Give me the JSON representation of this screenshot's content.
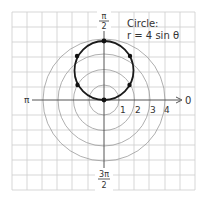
{
  "diagram": {
    "type": "polar-graph",
    "title_line1": "Circle:",
    "title_line2": "r = 4 sin θ",
    "angle_labels": {
      "right": "0",
      "left": "π",
      "top_num": "π",
      "top_den": "2",
      "bottom_num": "3π",
      "bottom_den": "2"
    },
    "radius_labels": [
      "1",
      "2",
      "3",
      "4"
    ],
    "reference_circles": [
      1,
      2,
      3,
      4
    ],
    "curve": {
      "equation": "r = 4 sin θ",
      "center_xy": [
        0,
        2
      ],
      "radius": 2
    },
    "plotted_points_polar": [
      {
        "theta": "0",
        "r": 0
      },
      {
        "theta": "π/6",
        "r": 2
      },
      {
        "theta": "π/3",
        "r": 3.46
      },
      {
        "theta": "π/2",
        "r": 4
      },
      {
        "theta": "2π/3",
        "r": 3.46
      },
      {
        "theta": "5π/6",
        "r": 2
      },
      {
        "theta": "π",
        "r": 0
      }
    ],
    "colors": {
      "grid": "#c8c8c8",
      "reference_circle": "#9a9a9a",
      "axis": "#555555",
      "curve": "#1a1a1a",
      "text": "#333333"
    }
  }
}
